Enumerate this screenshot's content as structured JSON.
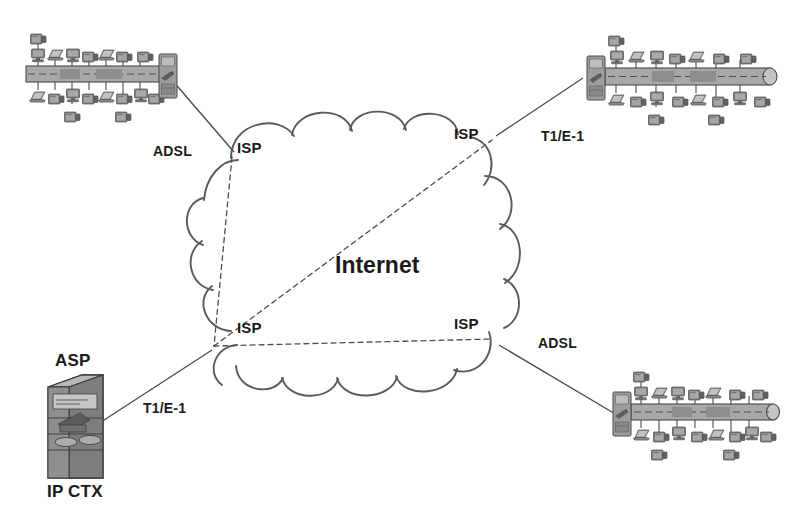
{
  "diagram": {
    "title": "Internet",
    "cloud_label": "Internet",
    "isp_nodes": [
      {
        "id": "isp-top-left",
        "label": "ISP",
        "x": 237,
        "y": 140
      },
      {
        "id": "isp-top-right",
        "label": "ISP",
        "x": 454,
        "y": 126
      },
      {
        "id": "isp-bottom-left",
        "label": "ISP",
        "x": 237,
        "y": 320
      },
      {
        "id": "isp-bottom-right",
        "label": "ISP",
        "x": 454,
        "y": 316
      }
    ],
    "sites": [
      {
        "id": "lan-top-left",
        "type": "lan-segment",
        "orientation": "gateway-right",
        "link_label": "ADSL",
        "link_x": 153,
        "link_y": 144,
        "workstations_top": 8,
        "workstations_bottom": 8
      },
      {
        "id": "lan-top-right",
        "type": "lan-segment",
        "orientation": "gateway-left",
        "link_label": "T1/E-1",
        "link_x": 541,
        "link_y": 129,
        "workstations_top": 8,
        "workstations_bottom": 8
      },
      {
        "id": "lan-bottom-right",
        "type": "lan-segment",
        "orientation": "gateway-left",
        "link_label": "ADSL",
        "link_x": 538,
        "link_y": 336,
        "workstations_top": 8,
        "workstations_bottom": 8
      },
      {
        "id": "asp-server",
        "type": "server-tower",
        "label_top": "ASP",
        "label_bottom": "IP  CTX",
        "link_label": "T1/E-1",
        "link_x": 143,
        "link_y": 401
      }
    ],
    "colors": {
      "line": "#4d4d4d",
      "cloud_stroke": "#5a5a5a",
      "text": "#1a1a1a",
      "device_fill": "#8c8c8c",
      "device_dark": "#5f5f5f",
      "device_light": "#b4b4b4",
      "bus_fill": "#a8a8a8",
      "background": "#ffffff"
    }
  }
}
